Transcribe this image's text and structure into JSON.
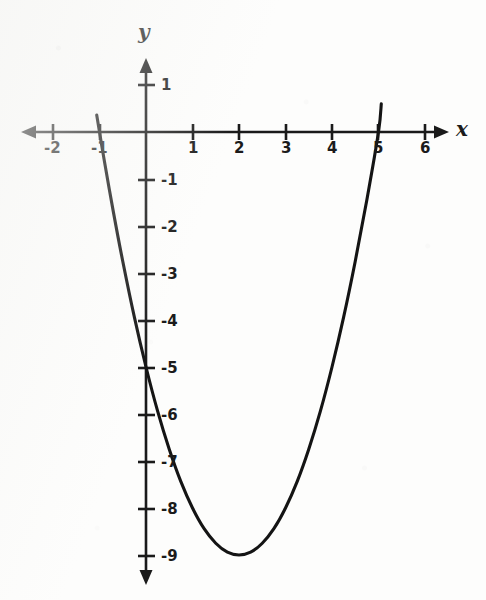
{
  "chart_data": {
    "type": "line",
    "title": "",
    "subtitle": "",
    "xlabel": "x",
    "ylabel": "y",
    "xlim": [
      -2.7,
      6.5
    ],
    "ylim": [
      -9.6,
      1.55
    ],
    "grid": false,
    "legend": "none",
    "equation": "y = x^2 - 4x - 5",
    "x_ticks": [
      "-2",
      "-1",
      "1",
      "2",
      "3",
      "4",
      "5",
      "6"
    ],
    "y_ticks": [
      "1",
      "-1",
      "-2",
      "-3",
      "-4",
      "-5",
      "-6",
      "-7",
      "-8",
      "-9"
    ],
    "x_tick_values": [
      -2,
      -1,
      1,
      2,
      3,
      4,
      5,
      6
    ],
    "y_tick_values": [
      1,
      -1,
      -2,
      -3,
      -4,
      -5,
      -6,
      -7,
      -8,
      -9
    ],
    "series": [
      {
        "name": "parabola",
        "color": "#141414",
        "x": [
          -1.06,
          -0.9,
          -0.7,
          -0.5,
          -0.25,
          0,
          0.25,
          0.5,
          0.75,
          1,
          1.25,
          1.5,
          1.75,
          2,
          2.25,
          2.5,
          2.75,
          3,
          3.25,
          3.5,
          3.75,
          4,
          4.25,
          4.5,
          4.75,
          5,
          5.06
        ],
        "y": [
          0.36,
          -0.59,
          -1.71,
          -2.75,
          -3.94,
          -5,
          -5.94,
          -6.75,
          -7.44,
          -8,
          -8.44,
          -8.75,
          -8.94,
          -9,
          -8.94,
          -8.75,
          -8.44,
          -8,
          -7.44,
          -6.75,
          -5.94,
          -5,
          -3.94,
          -2.75,
          -1.44,
          0,
          0.6
        ]
      }
    ],
    "roots": [
      -1,
      5
    ],
    "vertex": [
      2,
      -9
    ],
    "y_intercept": -6
  },
  "axes": {
    "x_axis_label": "x",
    "y_axis_label": "y"
  }
}
